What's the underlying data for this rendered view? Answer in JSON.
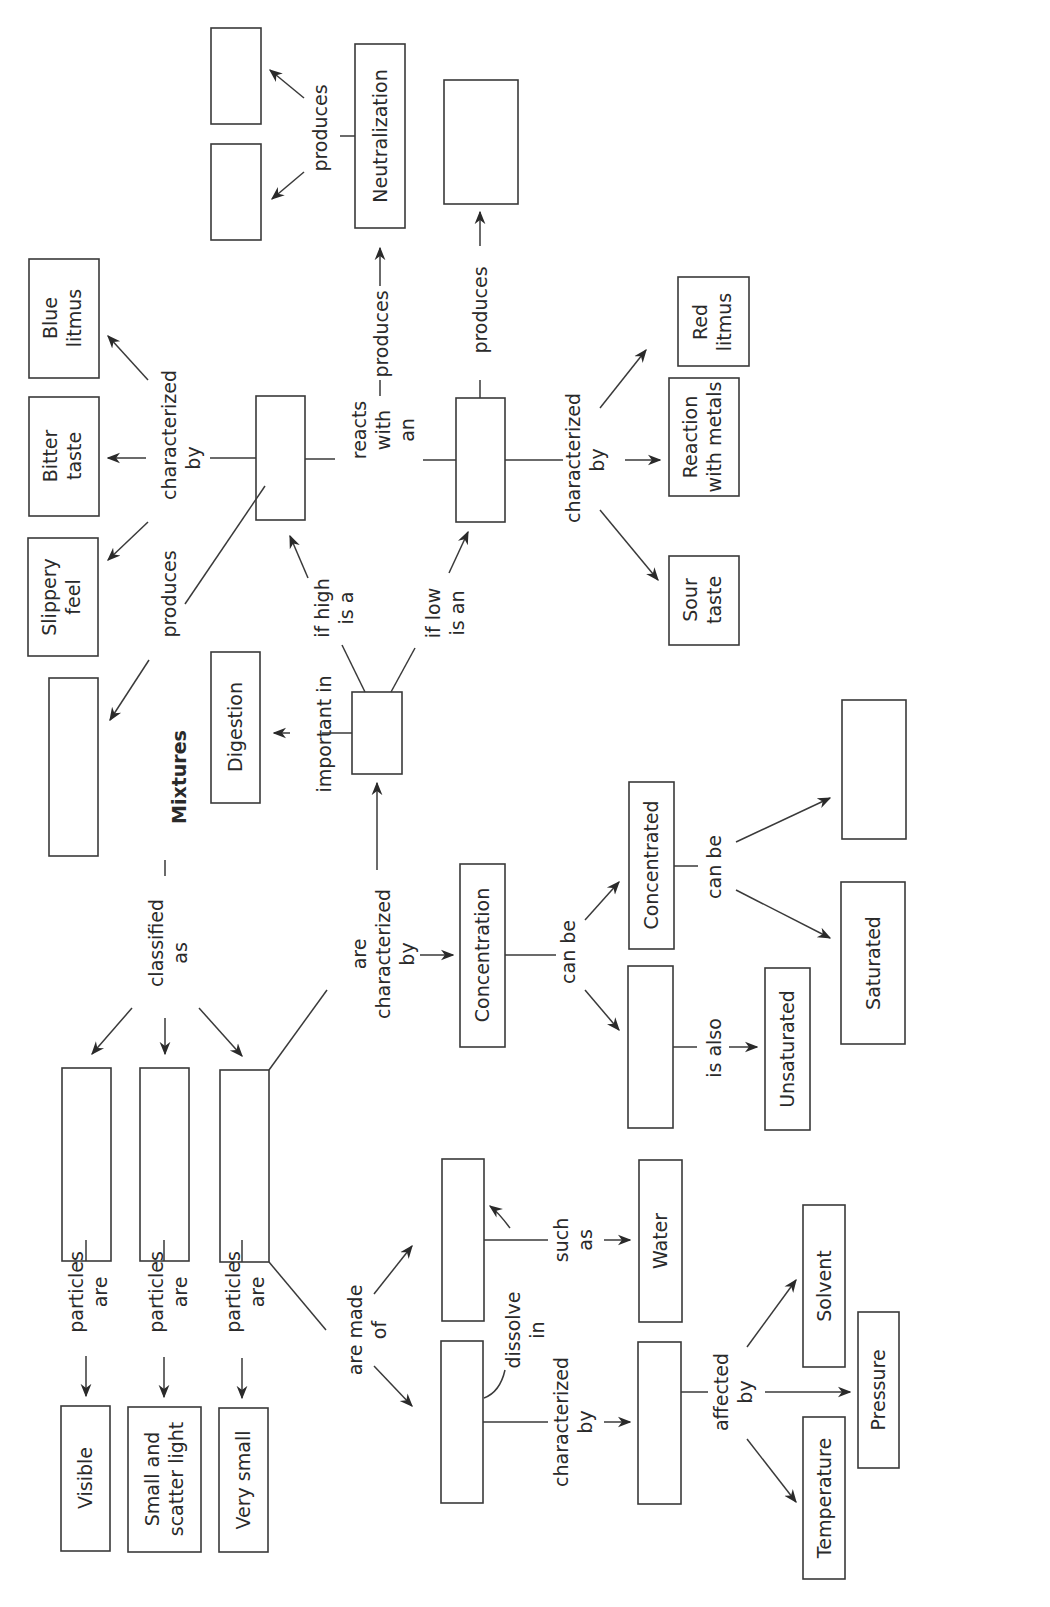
{
  "diagram": {
    "title": "Mixtures",
    "orientation": "rotated 90° counter-clockwise (text reads bottom-to-top)",
    "nodes": {
      "mixtures": "Mixtures",
      "visible": "Visible",
      "small_scatter_1": "Small and",
      "small_scatter_2": "scatter light",
      "very_small": "Very small",
      "concentration": "Concentration",
      "concentrated": "Concentrated",
      "unsaturated": "Unsaturated",
      "saturated": "Saturated",
      "digestion": "Digestion",
      "slippery_1": "Slippery",
      "slippery_2": "feel",
      "bitter_1": "Bitter",
      "bitter_2": "taste",
      "blue_1": "Blue",
      "blue_2": "litmus",
      "sour_1": "Sour",
      "sour_2": "taste",
      "metals_1": "Reaction",
      "metals_2": "with metals",
      "red_1": "Red",
      "red_2": "litmus",
      "neutralization": "Neutralization",
      "water": "Water",
      "solvent": "Solvent",
      "pressure": "Pressure",
      "temperature": "Temperature"
    },
    "links": {
      "classified_1": "classified",
      "classified_2": "as",
      "particles_are_1": "particles",
      "particles_are_2": "are",
      "are_made_of_1": "are made",
      "are_made_of_2": "of",
      "are_char_1": "are",
      "are_char_2": "characterized",
      "are_char_3": "by",
      "can_be": "can be",
      "is_also": "is also",
      "important_in": "important in",
      "if_high_1": "if high",
      "if_high_2": "is a",
      "if_low_1": "if low",
      "if_low_2": "is an",
      "char_by_1": "characterized",
      "char_by_2": "by",
      "produces": "produces",
      "reacts_1": "reacts",
      "reacts_2": "with",
      "reacts_3": "an",
      "such_as_1": "such",
      "such_as_2": "as",
      "dissolve_1": "dissolve",
      "dissolve_2": "in",
      "affected_1": "affected",
      "affected_2": "by"
    }
  }
}
